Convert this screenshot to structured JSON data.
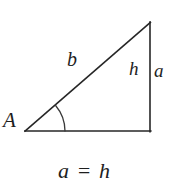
{
  "figure": {
    "type": "geometry-diagram",
    "background_color": "#ffffff",
    "stroke_color": "#262626",
    "text_color": "#1e1e1e",
    "triangle": {
      "vertices": {
        "A": {
          "x": 25,
          "y": 131
        },
        "bottom_right": {
          "x": 150,
          "y": 131
        },
        "apex": {
          "x": 150,
          "y": 22
        }
      },
      "angle_arc": {
        "at_vertex": "A",
        "radius": 40
      }
    },
    "labels": {
      "vertex_a": "A",
      "hypotenuse": "b",
      "height": "h",
      "opposite_side": "a"
    },
    "equation": "a = h"
  }
}
